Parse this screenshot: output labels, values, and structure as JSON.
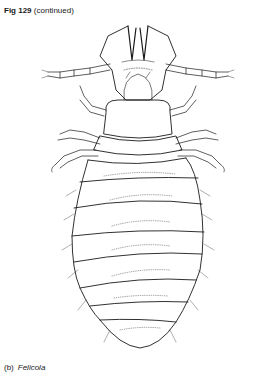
{
  "header": {
    "figure_number": "Fig 129",
    "continuation": "(continued)"
  },
  "figure": {
    "style": "line drawing, dorsal view",
    "abdominal_segments": 8,
    "ink_color": "#1a1a1a",
    "background_color": "#ffffff"
  },
  "footer": {
    "panel_label": "(b)",
    "genus": "Felicola"
  }
}
